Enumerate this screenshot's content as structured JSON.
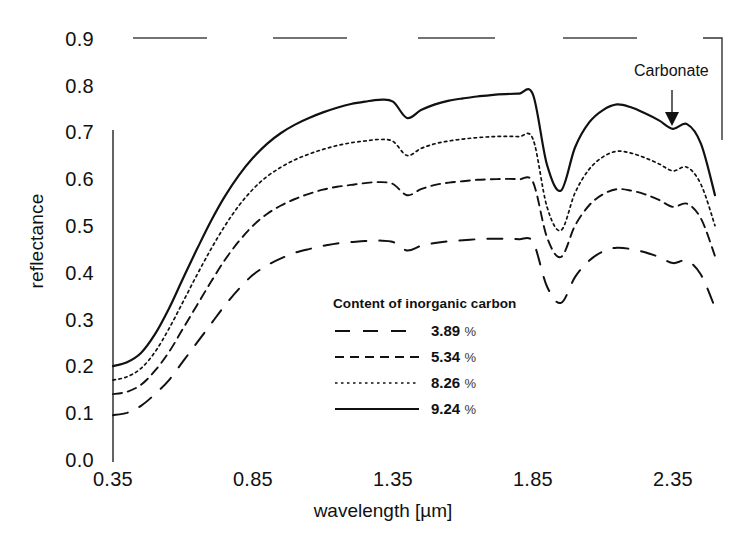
{
  "chart_data": {
    "type": "line",
    "title": "",
    "xlabel": "wavelength [µm]",
    "ylabel": "reflectance",
    "xlim": [
      0.35,
      2.5
    ],
    "ylim": [
      0.0,
      0.9
    ],
    "xticks": [
      "0.35",
      "0.85",
      "1.35",
      "1.85",
      "2.35"
    ],
    "xtick_values": [
      0.35,
      0.85,
      1.35,
      1.85,
      2.35
    ],
    "yticks": [
      "0.0",
      "0.1",
      "0.2",
      "0.3",
      "0.4",
      "0.5",
      "0.6",
      "0.7",
      "0.8",
      "0.9"
    ],
    "ytick_values": [
      0.0,
      0.1,
      0.2,
      0.3,
      0.4,
      0.5,
      0.6,
      0.7,
      0.8,
      0.9
    ],
    "grid": false,
    "legend_position": "inside-lower-center",
    "legend_title": "Content of inorganic carbon",
    "annotations": [
      {
        "text": "Carbonate",
        "x": 2.33,
        "y": 0.845,
        "arrow": "down",
        "arrow_to_y": 0.775
      }
    ],
    "x": [
      0.35,
      0.4,
      0.45,
      0.5,
      0.55,
      0.6,
      0.65,
      0.7,
      0.75,
      0.8,
      0.85,
      0.9,
      0.95,
      1.0,
      1.05,
      1.1,
      1.15,
      1.2,
      1.25,
      1.3,
      1.35,
      1.4,
      1.45,
      1.5,
      1.55,
      1.6,
      1.65,
      1.7,
      1.75,
      1.8,
      1.85,
      1.9,
      1.95,
      2.0,
      2.05,
      2.1,
      2.15,
      2.2,
      2.25,
      2.3,
      2.35,
      2.4,
      2.45,
      2.5
    ],
    "series": [
      {
        "name": "3.89 %",
        "style": "long-dash",
        "values": [
          0.1,
          0.105,
          0.12,
          0.145,
          0.175,
          0.215,
          0.255,
          0.295,
          0.335,
          0.37,
          0.4,
          0.42,
          0.435,
          0.447,
          0.455,
          0.462,
          0.467,
          0.47,
          0.472,
          0.473,
          0.47,
          0.452,
          0.462,
          0.468,
          0.472,
          0.474,
          0.476,
          0.477,
          0.477,
          0.476,
          0.47,
          0.375,
          0.34,
          0.395,
          0.43,
          0.45,
          0.458,
          0.455,
          0.448,
          0.438,
          0.425,
          0.43,
          0.4,
          0.33
        ]
      },
      {
        "name": "5.34 %",
        "style": "medium-dash",
        "values": [
          0.145,
          0.15,
          0.165,
          0.195,
          0.235,
          0.285,
          0.335,
          0.385,
          0.432,
          0.472,
          0.505,
          0.53,
          0.548,
          0.562,
          0.573,
          0.582,
          0.588,
          0.592,
          0.596,
          0.598,
          0.594,
          0.57,
          0.583,
          0.592,
          0.597,
          0.6,
          0.603,
          0.604,
          0.605,
          0.604,
          0.598,
          0.48,
          0.438,
          0.505,
          0.548,
          0.572,
          0.583,
          0.58,
          0.572,
          0.56,
          0.545,
          0.552,
          0.52,
          0.44
        ]
      },
      {
        "name": "8.26 %",
        "style": "dotted",
        "values": [
          0.175,
          0.182,
          0.2,
          0.235,
          0.285,
          0.342,
          0.4,
          0.455,
          0.505,
          0.548,
          0.583,
          0.61,
          0.63,
          0.646,
          0.658,
          0.668,
          0.676,
          0.682,
          0.686,
          0.689,
          0.685,
          0.655,
          0.67,
          0.68,
          0.686,
          0.69,
          0.693,
          0.695,
          0.696,
          0.695,
          0.69,
          0.545,
          0.495,
          0.575,
          0.625,
          0.652,
          0.664,
          0.66,
          0.65,
          0.637,
          0.622,
          0.63,
          0.593,
          0.505
        ]
      },
      {
        "name": "9.24 %",
        "style": "solid",
        "values": [
          0.205,
          0.213,
          0.233,
          0.273,
          0.328,
          0.392,
          0.455,
          0.515,
          0.568,
          0.613,
          0.65,
          0.68,
          0.703,
          0.721,
          0.735,
          0.747,
          0.757,
          0.765,
          0.77,
          0.774,
          0.77,
          0.735,
          0.752,
          0.764,
          0.772,
          0.777,
          0.781,
          0.784,
          0.786,
          0.787,
          0.785,
          0.635,
          0.58,
          0.672,
          0.725,
          0.752,
          0.764,
          0.758,
          0.745,
          0.73,
          0.712,
          0.722,
          0.68,
          0.57
        ]
      }
    ]
  },
  "axis": {
    "y_label": "reflectance",
    "x_label": "wavelength [µm]"
  },
  "legend": {
    "title": "Content of inorganic carbon",
    "items": [
      {
        "label": "3.89",
        "unit": "%"
      },
      {
        "label": "5.34",
        "unit": "%"
      },
      {
        "label": "8.26",
        "unit": "%"
      },
      {
        "label": "9.24",
        "unit": "%"
      }
    ]
  },
  "annotation": {
    "carbonate_label": "Carbonate"
  }
}
